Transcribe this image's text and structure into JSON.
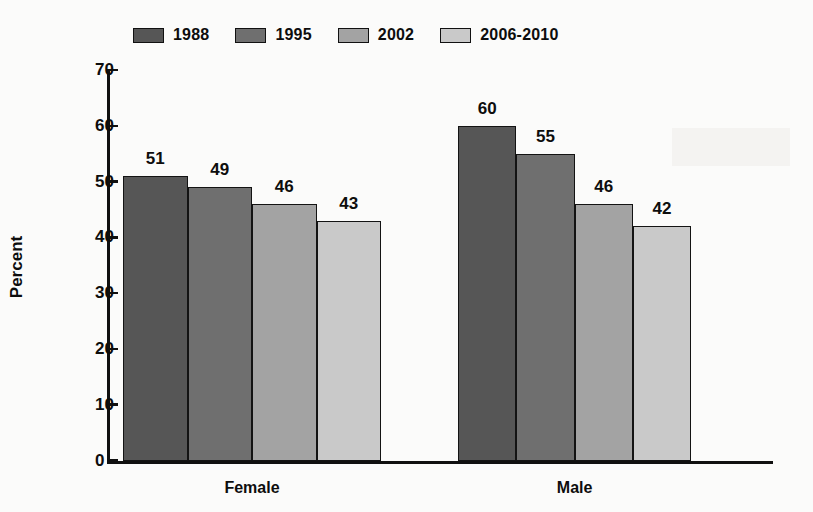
{
  "chart_data": {
    "type": "bar",
    "title": "",
    "xlabel": "",
    "ylabel": "Percent",
    "ylim": [
      0,
      70
    ],
    "yticks": [
      0,
      10,
      20,
      30,
      40,
      50,
      60,
      70
    ],
    "ytick_labels": [
      "0",
      "10",
      "20",
      "30",
      "40",
      "50",
      "60",
      "70"
    ],
    "grid": false,
    "legend_position": "top-left",
    "categories": [
      "Female",
      "Male"
    ],
    "series": [
      {
        "name": "1988",
        "color": "#565656",
        "values": [
          51,
          60
        ]
      },
      {
        "name": "1995",
        "color": "#6f6f6f",
        "values": [
          49,
          55
        ]
      },
      {
        "name": "2002",
        "color": "#a3a3a3",
        "values": [
          46,
          46
        ]
      },
      {
        "name": "2006-2010",
        "color": "#c9c9c9",
        "values": [
          43,
          42
        ]
      }
    ],
    "data_labels": {
      "Female": [
        "51",
        "49",
        "46",
        "43"
      ],
      "Male": [
        "60",
        "55",
        "46",
        "42"
      ]
    }
  },
  "legend": {
    "items": [
      {
        "label": "1988"
      },
      {
        "label": "1995"
      },
      {
        "label": "2002"
      },
      {
        "label": "2006-2010"
      }
    ]
  },
  "axes": {
    "y_title": "Percent",
    "y_labels": [
      "70",
      "60",
      "50",
      "40",
      "30",
      "20",
      "10",
      "0"
    ],
    "x_labels": [
      "Female",
      "Male"
    ]
  }
}
